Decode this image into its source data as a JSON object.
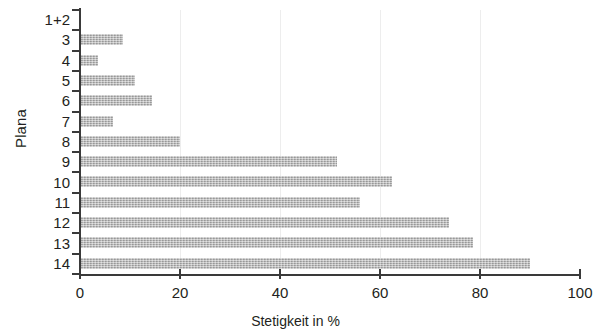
{
  "chart_data": {
    "type": "bar",
    "orientation": "horizontal",
    "title": "",
    "subtitle": "",
    "xlabel": "Stetigkeit in %",
    "ylabel": "Plana",
    "xlim": [
      0,
      100
    ],
    "xticks": [
      0,
      20,
      40,
      60,
      80,
      100
    ],
    "xtick_labels": [
      "0",
      "20",
      "40",
      "60",
      "80",
      "100"
    ],
    "grid": "vertical-only-light",
    "legend": null,
    "legend_position": "none",
    "bar_color": "#b7b7b7",
    "axis_color": "#3a3a3a",
    "gridline_color": "#ededed",
    "categories": [
      "1+2",
      "3",
      "4",
      "5",
      "6",
      "7",
      "8",
      "9",
      "10",
      "11",
      "12",
      "13",
      "14"
    ],
    "values": [
      0,
      8.6,
      3.6,
      11.0,
      14.4,
      6.6,
      20.0,
      51.4,
      62.4,
      56.0,
      73.8,
      78.6,
      90.0
    ],
    "series": [
      {
        "name": "Stetigkeit",
        "values": [
          0,
          8.6,
          3.6,
          11.0,
          14.4,
          6.6,
          20.0,
          51.4,
          62.4,
          56.0,
          73.8,
          78.6,
          90.0
        ]
      }
    ],
    "points": [
      {
        "category": "1+2",
        "value": 0
      },
      {
        "category": "3",
        "value": 8.6
      },
      {
        "category": "4",
        "value": 3.6
      },
      {
        "category": "5",
        "value": 11.0
      },
      {
        "category": "6",
        "value": 14.4
      },
      {
        "category": "7",
        "value": 6.6
      },
      {
        "category": "8",
        "value": 20.0
      },
      {
        "category": "9",
        "value": 51.4
      },
      {
        "category": "10",
        "value": 62.4
      },
      {
        "category": "11",
        "value": 56.0
      },
      {
        "category": "12",
        "value": 73.8
      },
      {
        "category": "13",
        "value": 78.6
      },
      {
        "category": "14",
        "value": 90.0
      }
    ]
  }
}
